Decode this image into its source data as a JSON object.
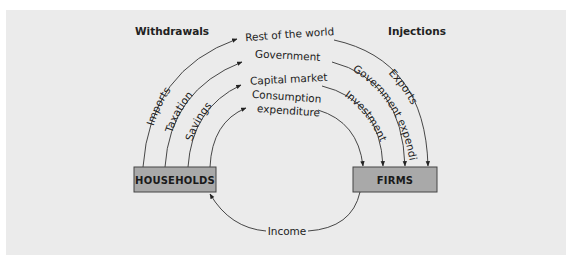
{
  "headers": {
    "withdrawals": "Withdrawals",
    "injections": "Injections"
  },
  "sectors": {
    "center": [
      "Rest of the world",
      "Government",
      "Capital market",
      "Consumption",
      "expenditure"
    ]
  },
  "withdrawal_flows": [
    "Imports",
    "Taxation",
    "Savings"
  ],
  "injection_flows": [
    "Exports",
    "Government expenditure",
    "Investment"
  ],
  "boxes": {
    "households": "HOUSEHOLDS",
    "firms": "FIRMS"
  },
  "income_label": "Income",
  "colors": {
    "panel_bg": "#ebebeb",
    "box_fill": "#a9a9a9",
    "line": "#333333"
  }
}
